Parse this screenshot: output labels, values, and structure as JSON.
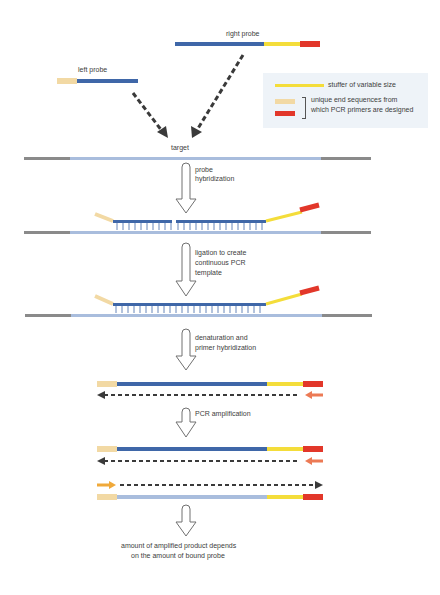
{
  "colors": {
    "probe_blue": "#3f67a8",
    "target_light_blue": "#a9bddd",
    "target_gray": "#8a8a8a",
    "stuffer_yellow": "#f4dd3a",
    "end_beige": "#f2d9a4",
    "end_red": "#e2372a",
    "primer_orange": "#ec7a55",
    "primer_amber": "#f0a93a",
    "arrow_dark": "#3a3a3a",
    "legend_bg": "#eef3f8"
  },
  "probes": {
    "right_probe_label": "right probe",
    "left_probe_label": "left probe"
  },
  "legend": {
    "stuffer": "stuffer of variable size",
    "end_sequences_line1": "unique end sequences from",
    "end_sequences_line2": "which PCR primers are designed"
  },
  "target_label": "target",
  "steps": [
    {
      "line1": "probe",
      "line2": "hybridization",
      "line3": ""
    },
    {
      "line1": "ligation to create",
      "line2": "continuous PCR",
      "line3": "template"
    },
    {
      "line1": "denaturation and",
      "line2": "primer hybridization",
      "line3": ""
    },
    {
      "line1": "PCR amplification",
      "line2": "",
      "line3": ""
    }
  ],
  "conclusion": {
    "line1": "amount of amplified product depends",
    "line2": "on the amount of bound probe"
  }
}
